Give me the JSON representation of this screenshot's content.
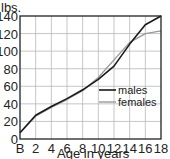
{
  "chart_data": {
    "type": "line",
    "title": "",
    "xlabel": "Age in years",
    "ylabel": "lbs.",
    "x": [
      "B",
      "2",
      "4",
      "6",
      "8",
      "10",
      "12",
      "14",
      "16",
      "18"
    ],
    "x_numeric": [
      0,
      2,
      4,
      6,
      8,
      10,
      12,
      14,
      16,
      18
    ],
    "xticks": [
      "B",
      "2",
      "4",
      "6",
      "8",
      "10",
      "12",
      "14",
      "16",
      "18"
    ],
    "yticks": [
      "0",
      "20",
      "40",
      "60",
      "80",
      "100",
      "120",
      "140"
    ],
    "xlim": [
      0,
      18
    ],
    "ylim": [
      0,
      140
    ],
    "grid": true,
    "legend_position": "lower right (inside plot)",
    "series": [
      {
        "name": "males",
        "color": "#1a1a1a",
        "values": [
          7,
          27,
          37,
          46,
          56,
          68,
          83,
          108,
          130,
          140
        ]
      },
      {
        "name": "females",
        "color": "#9a9a9a",
        "values": [
          7,
          26,
          36,
          45,
          55,
          70,
          90,
          110,
          120,
          123
        ]
      }
    ]
  },
  "axes": {
    "y_unit_label": "lbs.",
    "x_title": "Age in years"
  },
  "legend": {
    "males_label": "males",
    "females_label": "females"
  },
  "colors": {
    "grid": "#b8b8b8",
    "axis": "#222222",
    "males": "#1a1a1a",
    "females": "#9a9a9a"
  }
}
